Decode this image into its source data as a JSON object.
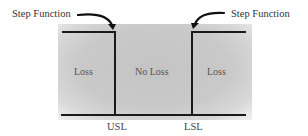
{
  "diagram": {
    "callouts": {
      "left": "Step Function",
      "right": "Step Function"
    },
    "zones": {
      "left": "Loss",
      "middle": "No Loss",
      "right": "Loss"
    },
    "limits": {
      "left": "USL",
      "right": "LSL"
    },
    "colors": {
      "line": "#1a1a1a",
      "panel": "#c6c6c6",
      "text": "#3a3a3a"
    }
  }
}
